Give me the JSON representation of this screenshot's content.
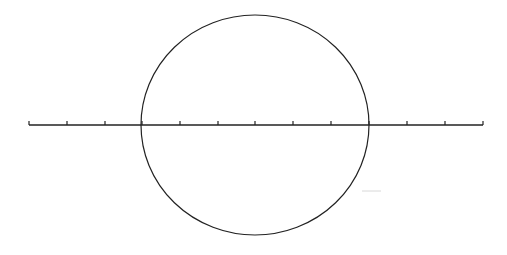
{
  "diagram": {
    "width": 507,
    "height": 255,
    "background": "#ffffff",
    "stroke_color": "#222222",
    "number_line": {
      "y": 125,
      "x_start": 29,
      "x_end": 483,
      "tick_xs": [
        29,
        67,
        105,
        142,
        180,
        218,
        255,
        293,
        331,
        369,
        407,
        445,
        483
      ],
      "tick_height": 4
    },
    "circle": {
      "cx": 255,
      "cy": 125,
      "rx": 114,
      "ry": 110
    },
    "faint_mark": {
      "x1": 362,
      "y1": 191,
      "x2": 381,
      "y2": 191,
      "color": "#d8d8d8"
    }
  }
}
